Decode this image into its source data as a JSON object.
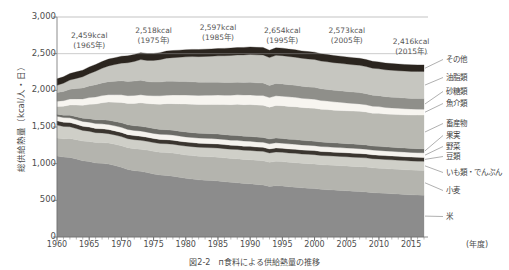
{
  "figure": {
    "caption": "図2-2　п食料による供給熱量の推移",
    "background": "#ffffff"
  },
  "chart_data": {
    "type": "area",
    "stacked": true,
    "title": "",
    "xlabel": "(年度)",
    "ylabel": "総供給熱量（kcal/人・日）",
    "xlim": [
      1960,
      2017
    ],
    "ylim": [
      0,
      3000
    ],
    "ytick_labels": [
      "3,000",
      "2,500",
      "2,000",
      "1,500",
      "1,000",
      "500",
      "0"
    ],
    "ytick_values": [
      3000,
      2500,
      2000,
      1500,
      1000,
      500,
      0
    ],
    "xtick_labels": [
      "1960",
      "1965",
      "1970",
      "1975",
      "1980",
      "1985",
      "1990",
      "1995",
      "2000",
      "2005",
      "2010",
      "2015"
    ],
    "xtick_values": [
      1960,
      1965,
      1970,
      1975,
      1980,
      1985,
      1990,
      1995,
      2000,
      2005,
      2010,
      2015
    ],
    "grid": false,
    "legend_position": "right",
    "x": [
      1960,
      1961,
      1962,
      1963,
      1964,
      1965,
      1966,
      1967,
      1968,
      1969,
      1970,
      1971,
      1972,
      1973,
      1974,
      1975,
      1976,
      1977,
      1978,
      1979,
      1980,
      1981,
      1982,
      1983,
      1984,
      1985,
      1986,
      1987,
      1988,
      1989,
      1990,
      1991,
      1992,
      1993,
      1994,
      1995,
      1996,
      1997,
      1998,
      1999,
      2000,
      2001,
      2002,
      2003,
      2004,
      2005,
      2006,
      2007,
      2008,
      2009,
      2010,
      2011,
      2012,
      2013,
      2014,
      2015,
      2016,
      2017
    ],
    "series": [
      {
        "name": "米",
        "color": "#8c8c8c",
        "values": [
          1106,
          1090,
          1085,
          1065,
          1040,
          1030,
          1010,
          1005,
          995,
          975,
          950,
          920,
          905,
          895,
          880,
          860,
          845,
          840,
          830,
          815,
          800,
          790,
          780,
          775,
          770,
          765,
          755,
          745,
          740,
          730,
          725,
          715,
          710,
          690,
          700,
          695,
          685,
          680,
          670,
          665,
          660,
          650,
          645,
          640,
          635,
          630,
          625,
          620,
          615,
          605,
          600,
          595,
          590,
          585,
          580,
          575,
          572,
          570
        ]
      },
      {
        "name": "小麦",
        "color": "#b4b4ae",
        "values": [
          245,
          250,
          258,
          262,
          268,
          272,
          278,
          282,
          286,
          290,
          295,
          298,
          300,
          302,
          305,
          308,
          310,
          312,
          314,
          316,
          318,
          320,
          321,
          322,
          323,
          324,
          325,
          326,
          327,
          328,
          329,
          330,
          331,
          330,
          332,
          333,
          334,
          334,
          335,
          335,
          336,
          336,
          337,
          337,
          338,
          338,
          338,
          339,
          339,
          338,
          338,
          338,
          338,
          338,
          338,
          338,
          338,
          338
        ]
      },
      {
        "name": "いも類・でんぷん",
        "color": "#cfcfc8",
        "values": [
          175,
          168,
          160,
          152,
          145,
          140,
          135,
          132,
          128,
          126,
          124,
          122,
          122,
          121,
          120,
          120,
          120,
          120,
          121,
          121,
          122,
          122,
          123,
          123,
          124,
          124,
          125,
          125,
          126,
          126,
          127,
          127,
          127,
          126,
          127,
          127,
          127,
          127,
          127,
          127,
          127,
          126,
          126,
          126,
          126,
          126,
          126,
          126,
          125,
          125,
          125,
          124,
          124,
          124,
          124,
          124,
          124,
          124
        ]
      },
      {
        "name": "豆類",
        "color": "#3a352f",
        "values": [
          58,
          58,
          58,
          57,
          57,
          57,
          56,
          56,
          56,
          56,
          56,
          56,
          56,
          56,
          55,
          55,
          55,
          55,
          55,
          55,
          55,
          55,
          55,
          55,
          55,
          55,
          55,
          55,
          55,
          55,
          55,
          55,
          55,
          55,
          55,
          55,
          55,
          55,
          55,
          55,
          55,
          54,
          54,
          54,
          54,
          54,
          54,
          54,
          54,
          53,
          53,
          53,
          53,
          53,
          53,
          53,
          53,
          53
        ]
      },
      {
        "name": "野菜",
        "color": "#f5f3ee",
        "values": [
          62,
          63,
          64,
          65,
          66,
          67,
          68,
          68,
          69,
          69,
          70,
          70,
          70,
          70,
          70,
          70,
          70,
          70,
          70,
          70,
          70,
          70,
          70,
          70,
          70,
          70,
          70,
          70,
          70,
          70,
          70,
          70,
          70,
          70,
          70,
          70,
          69,
          69,
          69,
          68,
          68,
          68,
          67,
          67,
          66,
          66,
          66,
          65,
          65,
          64,
          64,
          64,
          63,
          63,
          63,
          63,
          63,
          63
        ]
      },
      {
        "name": "果実",
        "color": "#6b6b66",
        "values": [
          28,
          32,
          36,
          40,
          44,
          48,
          52,
          55,
          58,
          60,
          62,
          63,
          64,
          65,
          65,
          66,
          66,
          66,
          66,
          66,
          66,
          66,
          66,
          66,
          66,
          66,
          66,
          66,
          66,
          66,
          66,
          65,
          65,
          64,
          65,
          64,
          63,
          63,
          62,
          62,
          61,
          61,
          60,
          60,
          59,
          59,
          58,
          58,
          57,
          56,
          56,
          55,
          55,
          55,
          54,
          54,
          54,
          54
        ]
      },
      {
        "name": "畜産物",
        "color": "#b9b9b2",
        "values": [
          105,
          122,
          140,
          158,
          175,
          195,
          215,
          232,
          248,
          262,
          278,
          292,
          305,
          320,
          325,
          335,
          345,
          355,
          362,
          372,
          382,
          388,
          392,
          396,
          400,
          404,
          410,
          418,
          425,
          430,
          435,
          438,
          440,
          436,
          445,
          446,
          448,
          448,
          448,
          448,
          450,
          447,
          448,
          446,
          448,
          448,
          450,
          452,
          450,
          448,
          450,
          448,
          450,
          452,
          454,
          456,
          458,
          460
        ]
      },
      {
        "name": "魚介類",
        "color": "#f7f5f0",
        "values": [
          72,
          76,
          80,
          84,
          88,
          92,
          96,
          98,
          100,
          102,
          104,
          106,
          108,
          110,
          110,
          112,
          114,
          116,
          118,
          120,
          122,
          123,
          124,
          125,
          126,
          127,
          128,
          129,
          130,
          130,
          131,
          131,
          131,
          130,
          131,
          131,
          130,
          128,
          126,
          124,
          122,
          119,
          116,
          113,
          110,
          107,
          104,
          101,
          98,
          95,
          92,
          89,
          87,
          85,
          83,
          82,
          81,
          80
        ]
      },
      {
        "name": "砂糖類",
        "color": "#8f8f8a",
        "values": [
          118,
          126,
          134,
          142,
          150,
          158,
          166,
          172,
          178,
          184,
          190,
          194,
          196,
          198,
          190,
          186,
          188,
          190,
          188,
          186,
          184,
          182,
          180,
          178,
          176,
          175,
          174,
          173,
          172,
          172,
          172,
          171,
          170,
          166,
          168,
          167,
          166,
          165,
          164,
          163,
          162,
          160,
          159,
          158,
          157,
          156,
          155,
          154,
          152,
          150,
          149,
          148,
          147,
          146,
          146,
          145,
          145,
          145
        ]
      },
      {
        "name": "油脂類",
        "color": "#c6c6c0",
        "values": [
          100,
          112,
          125,
          138,
          152,
          168,
          185,
          200,
          215,
          228,
          242,
          255,
          268,
          282,
          288,
          296,
          305,
          315,
          322,
          330,
          338,
          344,
          348,
          352,
          356,
          360,
          364,
          368,
          372,
          376,
          380,
          382,
          384,
          380,
          384,
          385,
          384,
          383,
          382,
          381,
          380,
          378,
          377,
          376,
          375,
          374,
          373,
          372,
          370,
          368,
          367,
          366,
          366,
          366,
          367,
          368,
          369,
          370
        ]
      },
      {
        "name": "その他",
        "color": "#2b251f",
        "values": [
          88,
          88,
          89,
          89,
          90,
          91,
          92,
          92,
          93,
          93,
          94,
          94,
          95,
          95,
          94,
          95,
          96,
          96,
          97,
          97,
          98,
          98,
          98,
          99,
          99,
          100,
          100,
          101,
          101,
          102,
          102,
          102,
          102,
          100,
          102,
          102,
          101,
          101,
          100,
          100,
          100,
          99,
          99,
          98,
          98,
          97,
          97,
          96,
          95,
          94,
          93,
          92,
          92,
          91,
          91,
          90,
          90,
          90
        ]
      }
    ],
    "annotations": [
      {
        "label": "2,459kcal",
        "sublabel": "(1965年)",
        "year": 1965,
        "value": 2459
      },
      {
        "label": "2,518kcal",
        "sublabel": "(1975年)",
        "year": 1975,
        "value": 2518
      },
      {
        "label": "2,597kcal",
        "sublabel": "(1985年)",
        "year": 1985,
        "value": 2597
      },
      {
        "label": "2,654kcal",
        "sublabel": "(1995年)",
        "year": 1995,
        "value": 2654
      },
      {
        "label": "2,573kcal",
        "sublabel": "(2005年)",
        "year": 2005,
        "value": 2573
      },
      {
        "label": "2,416kcal",
        "sublabel": "(2015年)",
        "year": 2015,
        "value": 2416
      }
    ],
    "legend": [
      {
        "label": "その他",
        "color": "#2b251f"
      },
      {
        "label": "油脂類",
        "color": "#c6c6c0"
      },
      {
        "label": "砂糖類",
        "color": "#8f8f8a"
      },
      {
        "label": "魚介類",
        "color": "#f7f5f0"
      },
      {
        "label": "畜産物",
        "color": "#b9b9b2"
      },
      {
        "label": "果実",
        "color": "#6b6b66"
      },
      {
        "label": "野菜",
        "color": "#f5f3ee"
      },
      {
        "label": "豆類",
        "color": "#3a352f"
      },
      {
        "label": "いも類・でんぷん",
        "color": "#cfcfc8"
      },
      {
        "label": "小麦",
        "color": "#b4b4ae"
      },
      {
        "label": "米",
        "color": "#8c8c8c"
      }
    ]
  }
}
